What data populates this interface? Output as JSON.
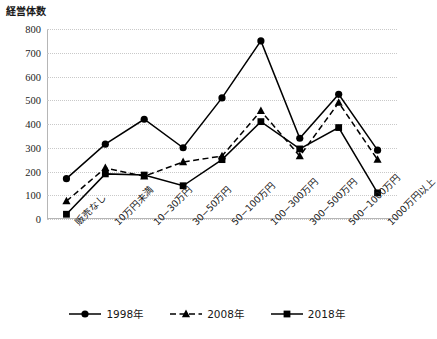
{
  "chart_data": {
    "type": "line",
    "title": "",
    "ylabel": "経営体数",
    "xlabel": "",
    "ylim": [
      0,
      800
    ],
    "ytick_step": 100,
    "yticks": [
      "800",
      "700",
      "600",
      "500",
      "400",
      "300",
      "200",
      "100",
      "0"
    ],
    "grid": true,
    "legend_position": "bottom",
    "categories": [
      "販売なし",
      "10万円未満",
      "10−30万円",
      "30−50万円",
      "50−100万円",
      "100−300万円",
      "300−500万円",
      "500−1000万円",
      "1000万円以上"
    ],
    "series": [
      {
        "name": "1998年",
        "marker": "circle",
        "line": "solid",
        "color": "#000000",
        "values": [
          170,
          315,
          420,
          300,
          510,
          750,
          340,
          525,
          290
        ]
      },
      {
        "name": "2008年",
        "marker": "triangle",
        "line": "dashed",
        "color": "#000000",
        "values": [
          75,
          215,
          180,
          240,
          265,
          455,
          265,
          490,
          250
        ]
      },
      {
        "name": "2018年",
        "marker": "square",
        "line": "solid",
        "color": "#000000",
        "values": [
          20,
          190,
          185,
          140,
          250,
          410,
          295,
          385,
          110
        ]
      }
    ]
  },
  "legend": {
    "items": [
      {
        "label": "1998年",
        "marker": "circle-marker"
      },
      {
        "label": "2008年",
        "marker": "triangle-marker"
      },
      {
        "label": "2018年",
        "marker": "square-marker"
      }
    ]
  }
}
